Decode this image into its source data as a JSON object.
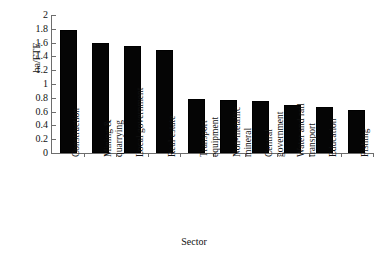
{
  "chart_data": {
    "type": "bar",
    "title": "",
    "xlabel": "Sector",
    "ylabel": "ha/FTE",
    "categories": [
      "Construction",
      "Mining & quarrying",
      "Local government",
      "Real estate",
      "Transport equipment",
      "Non-metallic mineral",
      "Central government",
      "Water and rail transport",
      "Education",
      "Fishing"
    ],
    "values": [
      1.79,
      1.59,
      1.55,
      1.49,
      0.79,
      0.77,
      0.76,
      0.7,
      0.67,
      0.63
    ],
    "ylim": [
      0,
      2
    ],
    "ytick_labels": [
      "2",
      "1.8",
      "1.6",
      "1.4",
      "1.2",
      "1",
      "0.8",
      "0.6",
      "0.4",
      "0.2",
      "0"
    ],
    "ytick_values": [
      2,
      1.8,
      1.6,
      1.4,
      1.2,
      1,
      0.8,
      0.6,
      0.4,
      0.2,
      0
    ],
    "grid": false,
    "legend": "none",
    "bar_color": "#050505",
    "axis_color": "#6d6d6d",
    "background": "#ffffff"
  }
}
